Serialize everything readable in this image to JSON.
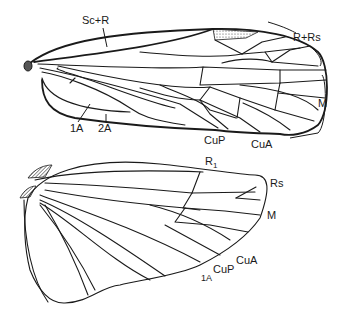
{
  "diagram": {
    "forewing": {
      "labels": {
        "sc_r": "Sc+R",
        "r_rs": "R+Rs",
        "m": "M",
        "cua": "CuA",
        "cup": "CuP",
        "a1": "1A",
        "a2": "2A"
      }
    },
    "hindwing": {
      "labels": {
        "r1_main": "R",
        "r1_sub": "1",
        "rs": "Rs",
        "m": "M",
        "cua": "CuA",
        "cup": "CuP",
        "a1": "1A"
      }
    },
    "colors": {
      "line": "#1a1a1a",
      "background": "#ffffff",
      "stipple": "#555555"
    }
  }
}
